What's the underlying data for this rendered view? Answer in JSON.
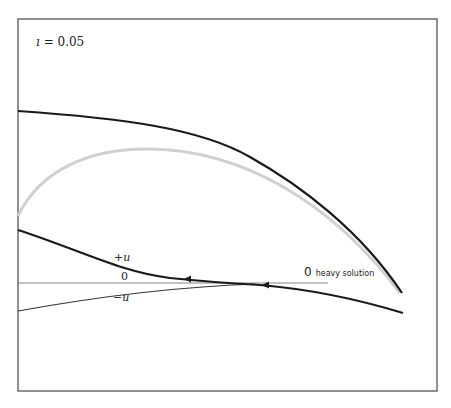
{
  "figure": {
    "parameter_label": {
      "symbol": "ı",
      "rest": " = 0.05"
    },
    "curve_labels": {
      "plus": "+u",
      "zero": "0",
      "minus": "−u"
    },
    "heavy_label": {
      "zero": "0",
      "text": "heavy solution"
    },
    "colors": {
      "frame": "#555555",
      "dark_curve": "#1a1a1a",
      "grey_curve": "#d0d0d0",
      "thin_line": "#777777"
    },
    "curves": [
      {
        "name": "upper-dark-curve",
        "path": "M18,111 C120,118 200,128 250,157 C300,185 360,230 402,293"
      },
      {
        "name": "grey-curve",
        "path": "M18,216 C40,170 90,148 150,149 C240,150 330,200 400,293"
      },
      {
        "name": "plus-u-curve",
        "path": "M18,230 C80,250 120,272 170,278 C210,282 240,284 260,285 C320,290 370,303 403,313"
      },
      {
        "name": "zero-line",
        "path": "M18,283 L328,283"
      },
      {
        "name": "minus-u-line",
        "path": "M18,311 C90,298 170,287 255,284"
      }
    ],
    "arrows": [
      {
        "name": "arrow-left-1",
        "x": 188,
        "y": 279
      },
      {
        "name": "arrow-left-2",
        "x": 266,
        "y": 285
      }
    ]
  }
}
